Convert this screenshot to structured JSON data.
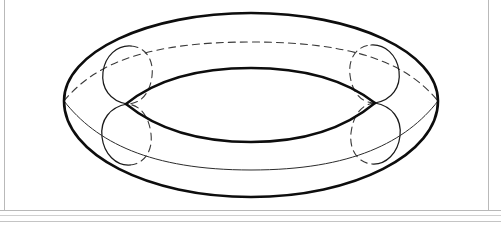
{
  "page": {
    "background_color": "#ffffff",
    "width": 501,
    "height": 226,
    "caption": ""
  },
  "figure": {
    "name": "torus-diagram",
    "stroke_color": "#0d0d0d",
    "thin_stroke_color": "#2b2b2b",
    "hidden_stroke_color": "#3a3a3a",
    "fill": "none",
    "stroke_width_outer": 2.6,
    "stroke_width_inner": 2.4,
    "stroke_width_thin": 1.0,
    "stroke_width_hidden": 1.1,
    "dash_pattern": "7 5",
    "parts": [
      {
        "id": "outer-silhouette",
        "label": "Outer silhouette ellipse",
        "style": "solid-thick"
      },
      {
        "id": "inner-hole",
        "label": "Inner hole lens contour",
        "style": "solid-thick"
      },
      {
        "id": "back-equator",
        "label": "Hidden back equator",
        "style": "dashed"
      },
      {
        "id": "front-equator",
        "label": "Visible front lower equator",
        "style": "solid-thin"
      },
      {
        "id": "cross-section-left-upper",
        "label": "Left upper cross-section circle",
        "style": "half-solid-half-dashed"
      },
      {
        "id": "cross-section-left-lower",
        "label": "Left lower cross-section circle",
        "style": "half-solid-half-dashed"
      },
      {
        "id": "cross-section-right-upper",
        "label": "Right upper cross-section circle",
        "style": "half-solid-half-dashed"
      },
      {
        "id": "cross-section-right-lower",
        "label": "Right lower cross-section circle",
        "style": "half-solid-half-dashed"
      }
    ]
  },
  "scan_edges": {
    "color": "#b9b9b9",
    "left_line_x": 4,
    "right_line_x": 488,
    "bottom_line_1_y": 210,
    "bottom_line_2_y": 215,
    "bottom_line_3_y": 221
  }
}
